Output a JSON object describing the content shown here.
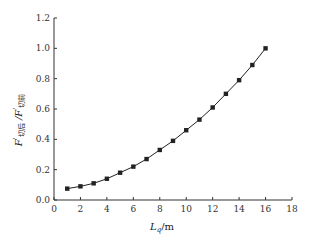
{
  "chart_data": {
    "type": "line",
    "title": "",
    "xlabel": "L_q/m",
    "xlabel_main": "L",
    "xlabel_sub": "q",
    "xlabel_unit": "/m",
    "ylabel": "F'切后 / F'切前",
    "ylabel_parts": {
      "f1": "F",
      "sup1": "'",
      "sub1": "切后",
      "sep": " /",
      "f2": "F",
      "sup2": "'",
      "sub2": "切前"
    },
    "xlim": [
      0,
      18
    ],
    "ylim": [
      0.0,
      1.2
    ],
    "xticks": [
      0,
      2,
      4,
      6,
      8,
      10,
      12,
      14,
      16,
      18
    ],
    "xtick_labels": [
      "0",
      "2",
      "4",
      "6",
      "8",
      "10",
      "12",
      "14",
      "16",
      "18"
    ],
    "yticks": [
      0.0,
      0.2,
      0.4,
      0.6,
      0.8,
      1.0,
      1.2
    ],
    "ytick_labels": [
      "0.0",
      "0.2",
      "0.4",
      "0.6",
      "0.8",
      "1.0",
      "1.2"
    ],
    "grid": false,
    "legend": null,
    "series": [
      {
        "name": "F'切后/F'切前",
        "marker": "square",
        "color": "#222222",
        "x": [
          1,
          2,
          3,
          4,
          5,
          6,
          7,
          8,
          9,
          10,
          11,
          12,
          13,
          14,
          15,
          16
        ],
        "values": [
          0.075,
          0.09,
          0.11,
          0.14,
          0.18,
          0.22,
          0.27,
          0.33,
          0.39,
          0.46,
          0.53,
          0.61,
          0.7,
          0.79,
          0.89,
          1.0
        ]
      }
    ]
  }
}
